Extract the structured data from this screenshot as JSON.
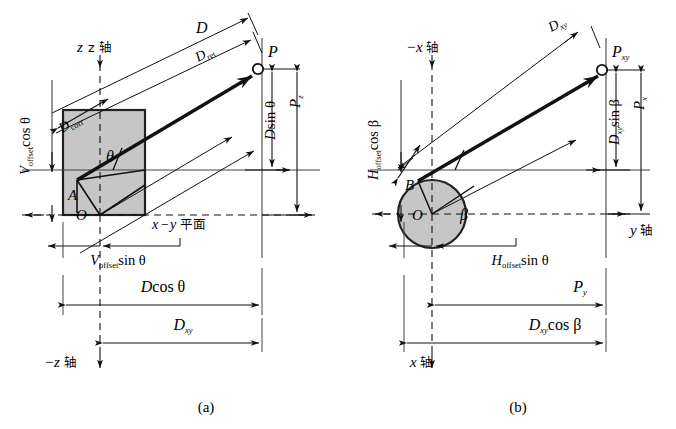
{
  "figure": {
    "title": "",
    "type": "technical-geometry-diagram",
    "panels": [
      {
        "id": "a",
        "caption": "(a)",
        "description": "Vertical (z) plane geometry with rectangular sensor body",
        "labels": {
          "axis_z_positive": "z 轴",
          "axis_z_negative": "-z 轴",
          "plane_xy": "x-y 平面",
          "point_P": "P",
          "point_A": "A",
          "point_O": "O",
          "angle_theta": "θ",
          "dist_D": "D",
          "dist_Dret_main": "D",
          "dist_Dret_sub": "ret",
          "dist_Dcorr_main": "D",
          "dist_Dcorr_sub": "corr",
          "Voffset_cos_main": "V",
          "Voffset_cos_sub": "offset",
          "Voffset_cos_tail": "cos θ",
          "Voffset_sin_main": "V",
          "Voffset_sin_sub": "offset",
          "Voffset_sin_tail": "sin θ",
          "Dsin_theta": "D",
          "Dsin_theta_tail": "sin θ",
          "Pz_main": "P",
          "Pz_sub": "z",
          "Dcos_theta": "D",
          "Dcos_theta_tail": "cos θ",
          "Dxy_main": "D",
          "Dxy_sub": "xy"
        }
      },
      {
        "id": "b",
        "caption": "(b)",
        "description": "Horizontal (x-y) plane geometry with circular sensor body",
        "labels": {
          "axis_x_negative": "-x 轴",
          "axis_x_positive": "x 轴",
          "axis_y": "y 轴",
          "point_Pxy_main": "P",
          "point_Pxy_sub": "xy",
          "point_B": "B",
          "point_O": "O",
          "angle_beta": "β",
          "dist_Dxy_main": "D",
          "dist_Dxy_sub": "xy",
          "Hoffset_cos_main": "H",
          "Hoffset_cos_sub": "offset",
          "Hoffset_cos_tail": "cos β",
          "Hoffset_sin_main": "H",
          "Hoffset_sin_sub": "offset",
          "Hoffset_sin_tail": "sin θ",
          "Dxysin_main": "D",
          "Dxysin_sub": "xy",
          "Dxysin_tail": "sin β",
          "Px_main": "P",
          "Px_sub": "x",
          "Py_main": "P",
          "Py_sub": "y",
          "Dxycos_main": "D",
          "Dxycos_sub": "xy",
          "Dxycos_tail": "cos β"
        }
      }
    ],
    "colors": {
      "stroke": "#111111",
      "fill_body": "#c6c6c6",
      "background": "#ffffff"
    }
  }
}
